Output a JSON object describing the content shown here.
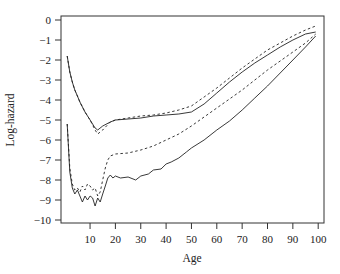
{
  "chart_data": {
    "type": "line",
    "title": "",
    "xlabel": "Age",
    "ylabel": "Log-hazard",
    "xlim": [
      0,
      101
    ],
    "ylim": [
      -10.2,
      0.2
    ],
    "x_ticks": [
      10,
      20,
      30,
      40,
      50,
      60,
      70,
      80,
      90,
      100
    ],
    "y_ticks": [
      0,
      -1,
      -2,
      -3,
      -4,
      -5,
      -6,
      -7,
      -8,
      -9,
      -10
    ],
    "grid": false,
    "legend": null,
    "series": [
      {
        "name": "upper-solid",
        "style": "solid",
        "color": "#222222",
        "x": [
          1,
          2,
          3,
          4,
          5,
          6,
          8,
          10,
          12,
          13,
          15,
          18,
          20,
          25,
          30,
          35,
          40,
          45,
          50,
          55,
          60,
          65,
          70,
          75,
          80,
          85,
          90,
          95,
          99
        ],
        "y": [
          -1.8,
          -2.6,
          -3.1,
          -3.5,
          -3.8,
          -4.1,
          -4.6,
          -5.0,
          -5.4,
          -5.5,
          -5.3,
          -5.1,
          -5.0,
          -4.95,
          -4.9,
          -4.8,
          -4.75,
          -4.7,
          -4.6,
          -4.2,
          -3.65,
          -3.1,
          -2.6,
          -2.15,
          -1.75,
          -1.35,
          -1.0,
          -0.7,
          -0.6
        ]
      },
      {
        "name": "upper-dashed",
        "style": "dashed",
        "color": "#222222",
        "x": [
          1,
          2,
          3,
          4,
          5,
          6,
          8,
          10,
          12,
          13,
          15,
          18,
          20,
          25,
          30,
          35,
          40,
          45,
          50,
          55,
          60,
          65,
          70,
          75,
          80,
          85,
          90,
          95,
          99
        ],
        "y": [
          -1.8,
          -2.6,
          -3.1,
          -3.5,
          -3.8,
          -4.1,
          -4.6,
          -5.0,
          -5.5,
          -5.7,
          -5.5,
          -5.1,
          -5.0,
          -4.9,
          -4.8,
          -4.75,
          -4.65,
          -4.5,
          -4.3,
          -3.85,
          -3.4,
          -2.9,
          -2.4,
          -1.95,
          -1.5,
          -1.15,
          -0.8,
          -0.5,
          -0.3
        ]
      },
      {
        "name": "lower-dashed",
        "style": "dashed",
        "color": "#222222",
        "x": [
          1,
          2,
          3,
          4,
          5,
          6,
          7,
          8,
          9,
          10,
          11,
          12,
          13,
          14,
          15,
          16,
          17,
          18,
          20,
          25,
          30,
          35,
          40,
          45,
          50,
          55,
          60,
          65,
          70,
          75,
          80,
          85,
          90,
          95,
          99
        ],
        "y": [
          -5.2,
          -7.4,
          -8.2,
          -8.5,
          -8.4,
          -8.6,
          -8.3,
          -8.5,
          -8.2,
          -8.3,
          -8.5,
          -8.4,
          -8.8,
          -8.6,
          -8.0,
          -7.4,
          -7.0,
          -6.8,
          -6.7,
          -6.65,
          -6.5,
          -6.3,
          -6.0,
          -5.7,
          -5.3,
          -4.85,
          -4.4,
          -3.95,
          -3.5,
          -3.0,
          -2.5,
          -2.05,
          -1.6,
          -1.15,
          -0.7
        ]
      },
      {
        "name": "lower-solid",
        "style": "solid",
        "color": "#222222",
        "x": [
          1,
          2,
          3,
          4,
          5,
          6,
          7,
          8,
          9,
          10,
          11,
          12,
          13,
          14,
          15,
          16,
          17,
          18,
          19,
          20,
          22,
          25,
          28,
          30,
          33,
          35,
          38,
          40,
          42,
          45,
          48,
          50,
          55,
          60,
          65,
          70,
          75,
          80,
          85,
          90,
          95,
          99
        ],
        "y": [
          -5.2,
          -7.6,
          -8.4,
          -8.7,
          -8.5,
          -8.8,
          -9.1,
          -8.8,
          -9.0,
          -8.8,
          -8.9,
          -9.3,
          -8.9,
          -9.1,
          -8.7,
          -8.3,
          -7.9,
          -7.75,
          -7.9,
          -7.8,
          -7.9,
          -7.85,
          -8.0,
          -7.8,
          -7.7,
          -7.5,
          -7.45,
          -7.2,
          -7.1,
          -6.9,
          -6.6,
          -6.4,
          -6.0,
          -5.5,
          -5.05,
          -4.5,
          -3.9,
          -3.3,
          -2.65,
          -2.0,
          -1.35,
          -0.8
        ]
      }
    ]
  },
  "axes": {
    "x_title": "Age",
    "y_title": "Log-hazard",
    "x_tick_labels": [
      "10",
      "20",
      "30",
      "40",
      "50",
      "60",
      "70",
      "80",
      "90",
      "100"
    ],
    "y_tick_labels": [
      "0",
      "-1",
      "-2",
      "-3",
      "-4",
      "-5",
      "-6",
      "-7",
      "-8",
      "-9",
      "-10"
    ]
  }
}
